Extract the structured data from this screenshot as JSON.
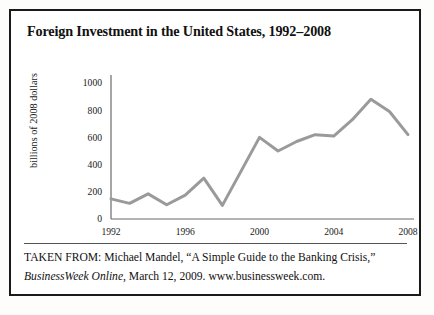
{
  "figure": {
    "title": "Foreign Investment in the United States, 1992–2008",
    "caption": {
      "line1_prefix": "TAKEN FROM: Michael Mandel, “A Simple Guide to the Banking",
      "line2_prefix": "Crisis,” ",
      "line2_italic": "BusinessWeek Online",
      "line2_suffix": ", March 12, 2009. www.businessweek.com."
    }
  },
  "chart_data": {
    "type": "line",
    "title": "Foreign Investment in the United States, 1992–2008",
    "xlabel": "",
    "ylabel": "billions of 2008 dollars",
    "x": [
      1992,
      1993,
      1994,
      1995,
      1996,
      1997,
      1998,
      1999,
      2000,
      2001,
      2002,
      2003,
      2004,
      2005,
      2006,
      2007,
      2008
    ],
    "values": [
      148,
      115,
      185,
      105,
      175,
      300,
      100,
      350,
      600,
      500,
      570,
      620,
      610,
      730,
      880,
      790,
      620
    ],
    "series": [
      {
        "name": "Foreign investment",
        "values": [
          148,
          115,
          185,
          105,
          175,
          300,
          100,
          350,
          600,
          500,
          570,
          620,
          610,
          730,
          880,
          790,
          620
        ]
      }
    ],
    "xlim": [
      1992,
      2008
    ],
    "ylim": [
      0,
      1000
    ],
    "xticks": [
      1992,
      1996,
      2000,
      2004,
      2008
    ],
    "xtick_labels": [
      "1992",
      "1996",
      "2000",
      "2004",
      "2008"
    ],
    "yticks": [
      0,
      200,
      400,
      600,
      800,
      1000
    ],
    "ytick_labels": [
      "0",
      "200",
      "400",
      "600",
      "800",
      "1000"
    ],
    "grid": false,
    "legend": false,
    "line_color": "#9a9a9a",
    "axis_color": "#6b6b6b"
  }
}
